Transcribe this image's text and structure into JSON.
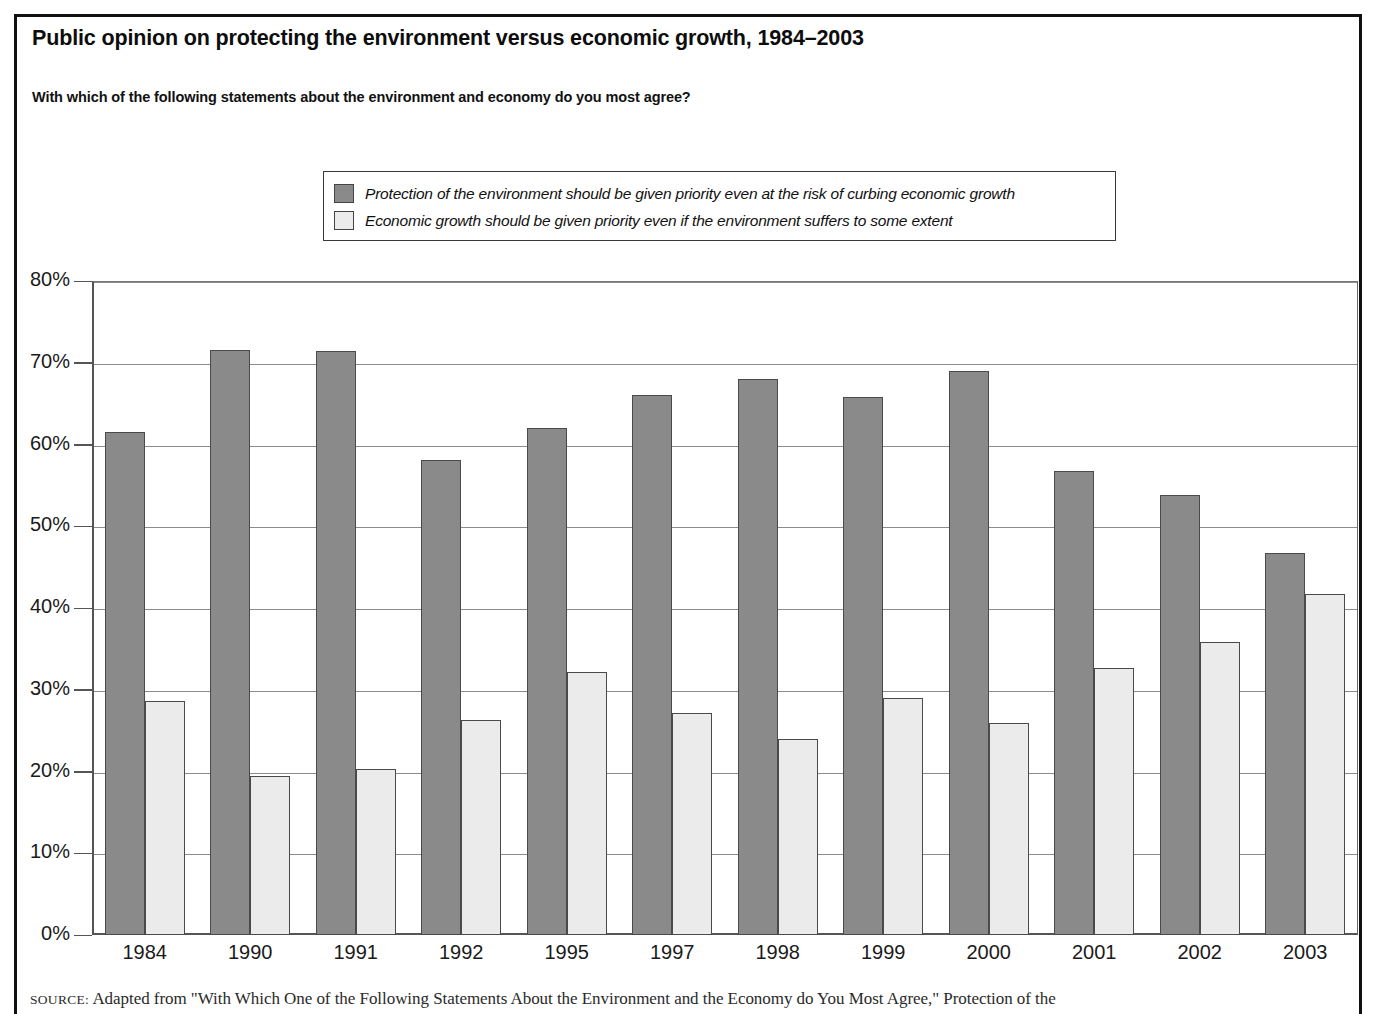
{
  "figure": {
    "title": "Public opinion on protecting the environment versus economic growth, 1984–2003",
    "subtitle": "With which of the following statements about the environment and economy do you most agree?",
    "source_prefix": "SOURCE:",
    "source_text": " Adapted from \"With Which One of the Following Statements About the Environment and the Economy do You Most Agree,\" Protection of the"
  },
  "legend": {
    "position": "top-center",
    "items": [
      {
        "label": "Protection of the environment should be given priority even at the risk of curbing economic growth",
        "color": "#8a8a8a"
      },
      {
        "label": "Economic growth should be given priority even if the environment suffers to some extent",
        "color": "#ebebeb"
      }
    ]
  },
  "axes": {
    "y_ticks": [
      "0%",
      "10%",
      "20%",
      "30%",
      "40%",
      "50%",
      "60%",
      "70%",
      "80%"
    ],
    "y_tick_values": [
      0,
      10,
      20,
      30,
      40,
      50,
      60,
      70,
      80
    ],
    "x_ticks": [
      "1984",
      "1990",
      "1991",
      "1992",
      "1995",
      "1997",
      "1998",
      "1999",
      "2000",
      "2001",
      "2002",
      "2003"
    ]
  },
  "chart_data": {
    "type": "bar",
    "title": "Public opinion on protecting the environment versus economic growth, 1984–2003",
    "subtitle": "With which of the following statements about the environment and economy do you most agree?",
    "xlabel": "",
    "ylabel": "",
    "ylim": [
      0,
      80
    ],
    "ytick_step": 10,
    "ytick_format": "percent",
    "grid": true,
    "legend_position": "top-center",
    "categories": [
      "1984",
      "1990",
      "1991",
      "1992",
      "1995",
      "1997",
      "1998",
      "1999",
      "2000",
      "2001",
      "2002",
      "2003"
    ],
    "series": [
      {
        "name": "Protection of the environment should be given priority even at the risk of curbing economic growth",
        "color": "#8a8a8a",
        "values": [
          61.5,
          71.5,
          71.4,
          58.1,
          62.0,
          66.0,
          68.0,
          65.8,
          69.0,
          56.8,
          53.8,
          46.7
        ]
      },
      {
        "name": "Economic growth should be given priority even if the environment suffers to some extent",
        "color": "#ebebeb",
        "values": [
          28.6,
          19.5,
          20.3,
          26.3,
          32.2,
          27.2,
          24.0,
          29.0,
          25.9,
          32.7,
          35.8,
          41.7
        ]
      }
    ]
  }
}
